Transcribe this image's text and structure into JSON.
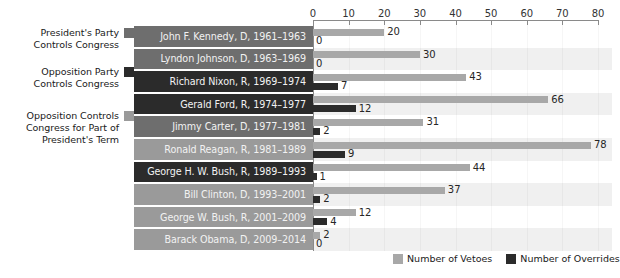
{
  "chart_data": {
    "type": "bar",
    "orientation": "horizontal",
    "title": "",
    "xlabel": "",
    "ylabel": "",
    "xlim": [
      0,
      80
    ],
    "xticks": [
      0,
      10,
      20,
      30,
      40,
      50,
      60,
      70,
      80
    ],
    "grid": false,
    "legend_position": "bottom-right",
    "categories": [
      "John F. Kennedy, D, 1961–1963",
      "Lyndon Johnson, D, 1963–1969",
      "Richard Nixon, R, 1969–1974",
      "Gerald Ford, R, 1974–1977",
      "Jimmy Carter, D, 1977–1981",
      "Ronald Reagan, R, 1981–1989",
      "George H. W. Bush, R, 1989–1993",
      "Bill Clinton, D, 1993–2001",
      "George W. Bush, R, 2001–2009",
      "Barack Obama, D, 2009–2014"
    ],
    "series": [
      {
        "name": "Number of Vetoes",
        "color": "#a8a8a8",
        "values": [
          20,
          30,
          43,
          66,
          31,
          78,
          44,
          37,
          12,
          2
        ]
      },
      {
        "name": "Number of Overrides",
        "color": "#2b2b2b",
        "values": [
          0,
          0,
          7,
          12,
          2,
          9,
          1,
          2,
          4,
          0
        ]
      }
    ],
    "row_control": [
      "president",
      "president",
      "opposition",
      "opposition",
      "president",
      "partial",
      "opposition",
      "partial",
      "partial",
      "partial"
    ]
  },
  "category_legend": {
    "entries": [
      {
        "label": "President's Party\nControls Congress",
        "swatch_name": "swatch-president-party",
        "color": "#6e6e6e"
      },
      {
        "label": "Opposition Party\nControls Congress",
        "swatch_name": "swatch-opposition-party",
        "color": "#2b2b2b"
      },
      {
        "label": "Opposition Controls\nCongress for Part of\nPresident's Term",
        "swatch_name": "swatch-opposition-partial",
        "color": "#9a9a9a"
      }
    ]
  },
  "series_legend": {
    "entries": [
      {
        "label": "Number of Vetoes",
        "color": "#a8a8a8"
      },
      {
        "label": "Number of Overrides",
        "color": "#2b2b2b"
      }
    ]
  },
  "colors": {
    "row_president": "#6e6e6e",
    "row_opposition": "#2b2b2b",
    "row_partial": "#9a9a9a",
    "plot_band_light": "#ffffff",
    "plot_band_tint": "#f0f0f0",
    "veto_bar": "#a8a8a8",
    "override_bar": "#2b2b2b",
    "axis": "#8a8a8a",
    "text_dark": "#1a1a1a",
    "text_light": "#f2f2f2"
  }
}
